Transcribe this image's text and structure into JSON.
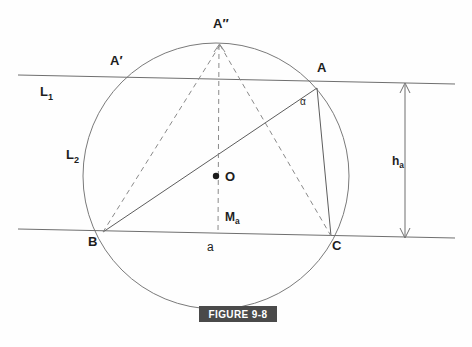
{
  "figure": {
    "caption": "FIGURE 9-8",
    "caption_bg": "#4a4a4a",
    "caption_color": "#ffffff",
    "background": "#fefefe",
    "stroke_color": "#6f6f6f"
  },
  "labels": {
    "A_double_prime": "A″",
    "A_prime": "A′",
    "A": "A",
    "B": "B",
    "C": "C",
    "O": "O",
    "L1": "L",
    "L1_sub": "1",
    "L2": "L",
    "L2_sub": "2",
    "Ma": "M",
    "Ma_sub": "a",
    "ha": "h",
    "ha_sub": "a",
    "side_a": "a",
    "alpha": "α"
  },
  "geometry": {
    "type": "circumscribed-triangle-construction",
    "circle": {
      "cx": 216,
      "cy": 176,
      "r": 133
    },
    "points": {
      "A": {
        "x": 317,
        "y": 88
      },
      "B": {
        "x": 103,
        "y": 232
      },
      "C": {
        "x": 331,
        "y": 236
      },
      "A_double_prime": {
        "x": 220,
        "y": 43
      },
      "A_prime": {
        "x": 126,
        "y": 76
      },
      "O": {
        "x": 216,
        "y": 176
      },
      "Ma": {
        "x": 218,
        "y": 234
      }
    },
    "lines": {
      "L1": {
        "x1": 18,
        "y1": 75,
        "x2": 455,
        "y2": 84
      },
      "L2": {
        "x1": 18,
        "y1": 229,
        "x2": 455,
        "y2": 238
      }
    },
    "dimension_arrow": {
      "x": 405,
      "y_top": 83,
      "y_bottom": 237,
      "label": "h_a"
    },
    "solid_segments": [
      "A-B",
      "A-C"
    ],
    "dashed_segments": [
      "A''-B",
      "A''-C",
      "A''-Ma"
    ]
  }
}
